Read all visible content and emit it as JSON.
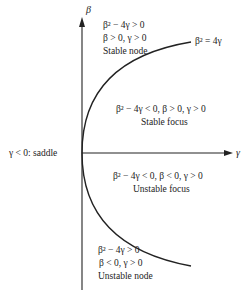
{
  "axes": {
    "vertical_label": "β",
    "horizontal_label": "γ"
  },
  "curve": {
    "label": "β² = 4γ"
  },
  "regions": {
    "stable_node": {
      "line1": "β² − 4γ > 0",
      "line2": "β > 0, γ > 0",
      "line3": "Stable node"
    },
    "stable_focus": {
      "line1": "β² − 4γ < 0, β > 0, γ > 0",
      "line2": "Stable focus"
    },
    "saddle": {
      "line1": "γ < 0:  saddle"
    },
    "unstable_focus": {
      "line1": "β² − 4γ < 0, β < 0, γ > 0",
      "line2": "Unstable focus"
    },
    "unstable_node": {
      "line1": "β² − 4γ > 0",
      "line2": "β < 0, γ > 0",
      "line3": "Unstable node"
    }
  },
  "colors": {
    "ink": "#222222",
    "background": "#ffffff"
  }
}
